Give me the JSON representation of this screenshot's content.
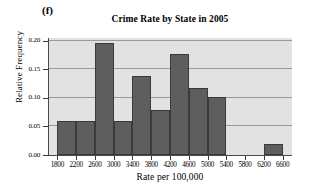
{
  "figure": {
    "panel_label": "(f)",
    "background": "#ffffff",
    "plot_background": "#e2e2e2",
    "bar_color": "#5e5e5e",
    "bar_edge_color": "#3a3a3a",
    "grid_color": "#9a9a9a"
  },
  "chart_data": {
    "type": "bar",
    "title": "Crime Rate by State in 2005",
    "xlabel": "Rate per 100,000",
    "ylabel": "Relative Frequency",
    "grid": true,
    "legend": null,
    "xlim": [
      1600,
      6800
    ],
    "ylim": [
      0.0,
      0.205
    ],
    "bin_width": 400,
    "xticks": [
      1800,
      2200,
      2600,
      3000,
      3400,
      3800,
      4200,
      4600,
      5000,
      5400,
      5800,
      6200,
      6600
    ],
    "xtick_labels": [
      "1800",
      "2200",
      "2600",
      "3000",
      "3400",
      "3800",
      "4200",
      "4600",
      "5000",
      "5400",
      "5800",
      "6200",
      "6600"
    ],
    "yticks": [
      0.0,
      0.05,
      0.1,
      0.15,
      0.2
    ],
    "ytick_labels": [
      "0.00",
      "0.05",
      "0.10",
      "0.15",
      "0.20"
    ],
    "bins": [
      {
        "start": 1800,
        "end": 2200,
        "value": 0.059
      },
      {
        "start": 2200,
        "end": 2600,
        "value": 0.059
      },
      {
        "start": 2600,
        "end": 3000,
        "value": 0.196
      },
      {
        "start": 3000,
        "end": 3400,
        "value": 0.059
      },
      {
        "start": 3400,
        "end": 3800,
        "value": 0.138
      },
      {
        "start": 3800,
        "end": 4200,
        "value": 0.079
      },
      {
        "start": 4200,
        "end": 4600,
        "value": 0.177
      },
      {
        "start": 4600,
        "end": 5000,
        "value": 0.118
      },
      {
        "start": 5000,
        "end": 5400,
        "value": 0.101
      },
      {
        "start": 5400,
        "end": 5800,
        "value": 0.0
      },
      {
        "start": 5800,
        "end": 6200,
        "value": 0.0
      },
      {
        "start": 6200,
        "end": 6600,
        "value": 0.02
      }
    ],
    "categories": [
      "1800-2200",
      "2200-2600",
      "2600-3000",
      "3000-3400",
      "3400-3800",
      "3800-4200",
      "4200-4600",
      "4600-5000",
      "5000-5400",
      "5400-5800",
      "5800-6200",
      "6200-6600"
    ],
    "values": [
      0.059,
      0.059,
      0.196,
      0.059,
      0.138,
      0.079,
      0.177,
      0.118,
      0.101,
      0.0,
      0.0,
      0.02
    ]
  }
}
